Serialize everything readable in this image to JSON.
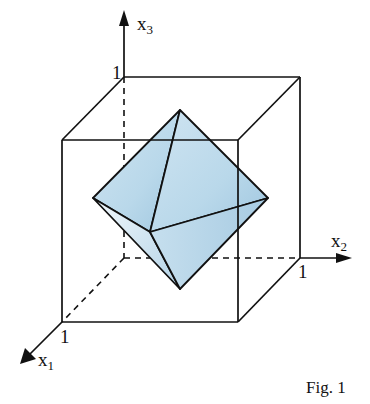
{
  "figure": {
    "caption": "Fig. 1",
    "axes": {
      "x1": {
        "name": "x",
        "sub": "1",
        "tick": "1"
      },
      "x2": {
        "name": "x",
        "sub": "2",
        "tick": "1"
      },
      "x3": {
        "name": "x",
        "sub": "3",
        "tick": "1"
      }
    },
    "shapes": [
      "unit-cube",
      "octahedron"
    ],
    "colors": {
      "line": "#111111",
      "octahedron_fill_light": "#e4f0f8",
      "octahedron_fill_dark": "#a9cde3"
    }
  }
}
